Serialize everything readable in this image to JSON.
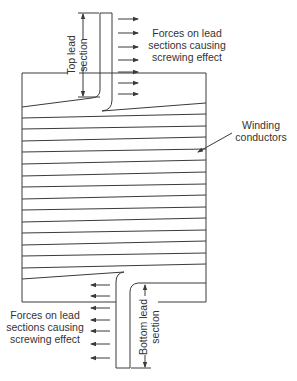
{
  "diagram": {
    "type": "transformer-winding-lead-forces",
    "colors": {
      "line": "#3a3a3a",
      "text": "#333333",
      "background": "#ffffff"
    },
    "labels": {
      "top_lead_line1": "Top lead",
      "top_lead_line2": "section",
      "top_forces_line1": "Forces on lead",
      "top_forces_line2": "sections causing",
      "top_forces_line3": "screwing effect",
      "winding_line1": "Winding",
      "winding_line2": "conductors",
      "bottom_forces_line1": "Forces on lead",
      "bottom_forces_line2": "sections causing",
      "bottom_forces_line3": "screwing effect",
      "bottom_lead_line1": "Bottom lead",
      "bottom_lead_line2": "section"
    },
    "top_force_arrows": {
      "count": 7,
      "direction": "right"
    },
    "bottom_force_arrows": {
      "count": 7,
      "direction": "left"
    },
    "winding_conductor_count": 16
  }
}
